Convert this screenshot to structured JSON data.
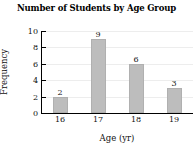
{
  "chart_data": {
    "type": "bar",
    "title": "Number of Students by Age Group",
    "xlabel": "Age (yr)",
    "ylabel": "Frequency",
    "categories": [
      "16",
      "17",
      "18",
      "19"
    ],
    "values": [
      2,
      9,
      6,
      3
    ],
    "bar_labels": [
      "2",
      "9",
      "6",
      "3"
    ],
    "ylim": [
      0,
      10
    ],
    "yticks": [
      0,
      2,
      4,
      6,
      8,
      10
    ],
    "ytick_labels": [
      "0",
      "2",
      "4",
      "6",
      "8",
      "10"
    ],
    "grid": true,
    "legend": "none",
    "bar_color": "#bdbdbd",
    "axis_color": "#000000",
    "grid_color": "#ededed"
  }
}
